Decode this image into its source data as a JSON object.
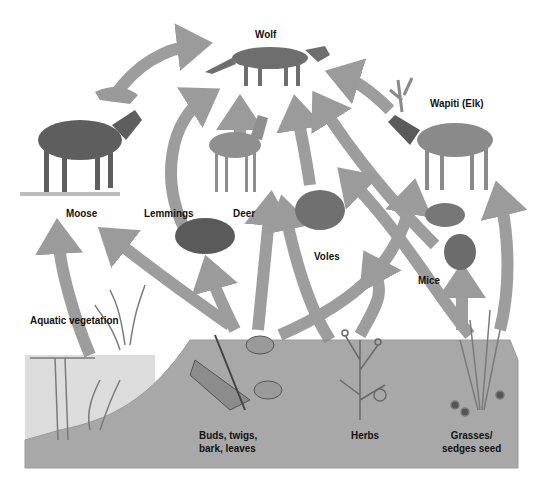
{
  "nodes": {
    "wolf": "Wolf",
    "moose": "Moose",
    "wapiti": "Wapiti (Elk)",
    "lemmings": "Lemmings",
    "deer": "Deer",
    "voles": "Voles",
    "mice": "Mice",
    "aquatic": "Aquatic vegetation",
    "buds_line1": "Buds, twigs,",
    "buds_line2": "bark, leaves",
    "herbs": "Herbs",
    "grasses_line1": "Grasses/",
    "grasses_line2": "sedges seed"
  },
  "colors": {
    "arrow": "#8a8a8a",
    "ground": "#a9a9a9",
    "water": "#d9d9d9",
    "animal": "#6e6e6e",
    "plant": "#7a7a7a"
  }
}
